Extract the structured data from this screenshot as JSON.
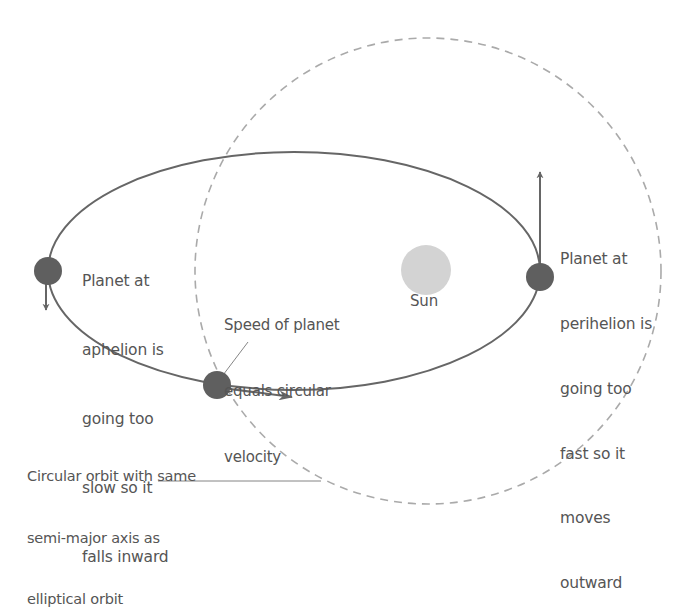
{
  "diagram": {
    "type": "orbital-diagram",
    "colors": {
      "ellipse_stroke": "#666666",
      "circle_dashed_stroke": "#aaaaaa",
      "planet_fill": "#5f5f5f",
      "sun_fill": "#d3d3d3",
      "arrow": "#666666",
      "text": "#555555",
      "leader_line": "#777777"
    },
    "sun": {
      "label": "Sun"
    },
    "labels": {
      "aphelion": [
        "Planet at",
        "aphelion is",
        "going too",
        "slow so it",
        "falls inward"
      ],
      "perihelion": [
        "Planet at",
        "perihelion is",
        "going too",
        "fast so it",
        "moves",
        "outward"
      ],
      "circular_speed": [
        "Speed of planet",
        "equals circular",
        "velocity"
      ],
      "circular_orbit": [
        "Circular orbit with same",
        "semi-major axis as",
        "elliptical orbit"
      ]
    },
    "nodes": [
      {
        "id": "planet-aphelion",
        "x": 48,
        "y": 271
      },
      {
        "id": "planet-perihelion",
        "x": 540,
        "y": 277
      },
      {
        "id": "planet-circular-crossing",
        "x": 217,
        "y": 385
      },
      {
        "id": "sun",
        "x": 426,
        "y": 270
      }
    ],
    "edges": [
      {
        "from": "planet-aphelion",
        "kind": "velocity-arrow",
        "direction": "down"
      },
      {
        "from": "planet-perihelion",
        "kind": "velocity-arrow",
        "direction": "up"
      },
      {
        "from": "planet-circular-crossing",
        "kind": "velocity-arrow",
        "direction": "right"
      }
    ]
  }
}
